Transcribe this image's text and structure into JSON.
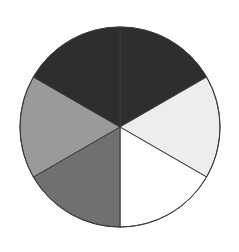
{
  "figure": {
    "background_color": "#ffffff",
    "width": 239,
    "height": 252
  },
  "chart_data": {
    "type": "pie",
    "title": "",
    "xlabel": "",
    "ylabel": "",
    "legend_position": "none",
    "grid": false,
    "center_x": 120,
    "center_y": 127,
    "radius": 100,
    "start_angle_deg": -90,
    "direction": "clockwise",
    "outline_color": "#3a3a3a",
    "outline_width": 1,
    "categories": [
      "Sector 1",
      "Sector 2",
      "Sector 3",
      "Sector 4",
      "Sector 5",
      "Sector 6"
    ],
    "values": [
      60,
      60,
      60,
      60,
      60,
      60
    ],
    "percentages": [
      "16.7%",
      "16.7%",
      "16.7%",
      "16.7%",
      "16.7%",
      "16.7%"
    ],
    "slices": [
      {
        "name": "Sector 1",
        "position": "top-right",
        "value": 60,
        "percent": 16.7,
        "fill": "#2e2e2e",
        "start_deg": -90,
        "end_deg": -30
      },
      {
        "name": "Sector 2",
        "position": "right",
        "value": 60,
        "percent": 16.7,
        "fill": "#ededed",
        "start_deg": -30,
        "end_deg": 30
      },
      {
        "name": "Sector 3",
        "position": "bottom-right",
        "value": 60,
        "percent": 16.7,
        "fill": "#ffffff",
        "start_deg": 30,
        "end_deg": 90
      },
      {
        "name": "Sector 4",
        "position": "bottom-left",
        "value": 60,
        "percent": 16.7,
        "fill": "#707070",
        "start_deg": 90,
        "end_deg": 150
      },
      {
        "name": "Sector 5",
        "position": "left",
        "value": 60,
        "percent": 16.7,
        "fill": "#9a9a9a",
        "start_deg": 150,
        "end_deg": 210
      },
      {
        "name": "Sector 6",
        "position": "top-left",
        "value": 60,
        "percent": 16.7,
        "fill": "#2e2e2e",
        "start_deg": 210,
        "end_deg": 270
      }
    ]
  }
}
